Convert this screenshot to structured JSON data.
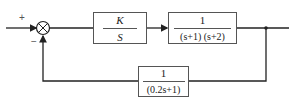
{
  "diagram": {
    "type": "feedback-control-block-diagram",
    "summing_junction": {
      "plus_sign": "+",
      "minus_sign": "−"
    },
    "blocks": [
      {
        "id": "controller",
        "numerator": "K",
        "denominator": "S"
      },
      {
        "id": "plant",
        "numerator": "1",
        "denominator": "(s+1) (s+2)"
      },
      {
        "id": "feedback",
        "numerator": "1",
        "denominator": "(0.2s+1)"
      }
    ],
    "colors": {
      "line": "#222222",
      "block_border": "#555555"
    }
  }
}
